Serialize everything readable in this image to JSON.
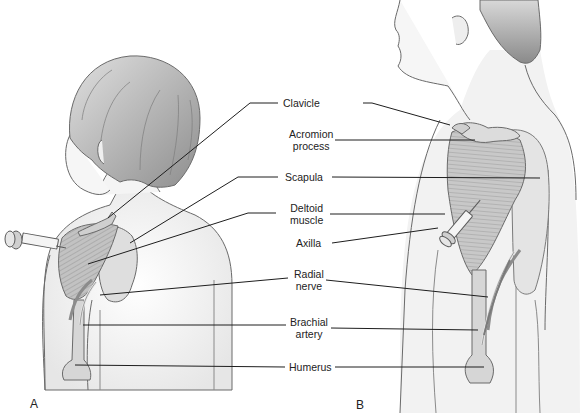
{
  "figure": {
    "panels": [
      {
        "id": "A",
        "label": "A",
        "description": "Child viewed from behind, syringe injecting deltoid"
      },
      {
        "id": "B",
        "label": "B",
        "description": "Adult side view, syringe injecting deltoid"
      }
    ],
    "labels": {
      "clavicle": "Clavicle",
      "acromion_line1": "Acromion",
      "acromion_line2": "process",
      "scapula": "Scapula",
      "deltoid_line1": "Deltoid",
      "deltoid_line2": "muscle",
      "axilla": "Axilla",
      "radial_line1": "Radial",
      "radial_line2": "nerve",
      "brachial_line1": "Brachial",
      "brachial_line2": "artery",
      "humerus": "Humerus"
    },
    "colors": {
      "outline": "#6a6a6a",
      "skin": "#f1f1f1",
      "hair": "#a8a8a8",
      "muscle": "#c4c4c4",
      "bone": "#d6d6d6",
      "vessel": "#8a8a8a",
      "leader": "#1e1e1e"
    }
  }
}
